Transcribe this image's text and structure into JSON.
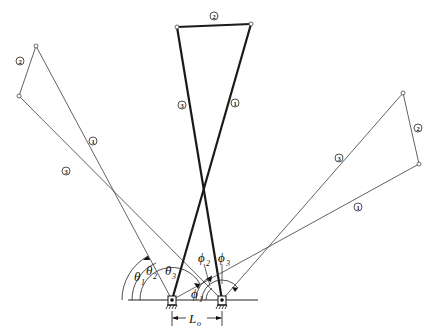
{
  "diagram": {
    "type": "four-bar linkage positions",
    "ground_pivots": {
      "A": {
        "x": 172,
        "y": 300
      },
      "B": {
        "x": 222,
        "y": 300
      }
    },
    "positions": [
      {
        "name": "left",
        "link1_end": {
          "x": 36,
          "y": 46
        },
        "link3_end": {
          "x": 19,
          "y": 96
        },
        "labels": {
          "link1": "1",
          "link2": "2",
          "link3": "3"
        }
      },
      {
        "name": "center",
        "link1_end": {
          "x": 251,
          "y": 24
        },
        "link3_end": {
          "x": 177,
          "y": 27
        },
        "labels": {
          "link1": "1",
          "link2": "2",
          "link3": "3"
        }
      },
      {
        "name": "right",
        "link1_end": {
          "x": 419,
          "y": 164
        },
        "link3_end": {
          "x": 403,
          "y": 93
        },
        "labels": {
          "link1": "1",
          "link2": "2",
          "link3": "3"
        }
      }
    ],
    "angle_labels": {
      "theta1": {
        "symbol": "θ",
        "sub": "1"
      },
      "theta2": {
        "symbol": "θ",
        "sub": "2"
      },
      "theta3": {
        "symbol": "θ",
        "sub": "3"
      },
      "phi1": {
        "symbol": "ϕ",
        "sub": "1"
      },
      "phi2": {
        "symbol": "ϕ",
        "sub": "2"
      },
      "phi3": {
        "symbol": "ϕ",
        "sub": "3"
      }
    },
    "dimension": {
      "symbol": "L",
      "sub": "o"
    },
    "link_numbers": {
      "one": "1",
      "two": "2",
      "three": "3"
    }
  }
}
